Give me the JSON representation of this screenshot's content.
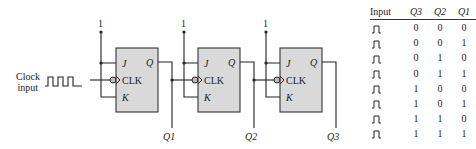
{
  "diagram": {
    "clock_label_line1": "Clock",
    "clock_label_line2": "input",
    "high_label": "1",
    "flipflops": [
      {
        "j": "J",
        "k": "K",
        "clk": "CLK",
        "q": "Q",
        "output": "Q1"
      },
      {
        "j": "J",
        "k": "K",
        "clk": "CLK",
        "q": "Q",
        "output": "Q2"
      },
      {
        "j": "J",
        "k": "K",
        "clk": "CLK",
        "q": "Q",
        "output": "Q3"
      }
    ],
    "colors": {
      "box_fill": "#d9d9d9",
      "line": "#222222"
    }
  },
  "table": {
    "headers": [
      "Input",
      "Q3",
      "Q2",
      "Q1"
    ],
    "rows": [
      [
        "pulse",
        "0",
        "0",
        "0"
      ],
      [
        "pulse",
        "0",
        "0",
        "1"
      ],
      [
        "pulse",
        "0",
        "1",
        "0"
      ],
      [
        "pulse",
        "0",
        "1",
        "1"
      ],
      [
        "pulse",
        "1",
        "0",
        "0"
      ],
      [
        "pulse",
        "1",
        "0",
        "1"
      ],
      [
        "pulse",
        "1",
        "1",
        "0"
      ],
      [
        "pulse",
        "1",
        "1",
        "1"
      ]
    ]
  }
}
